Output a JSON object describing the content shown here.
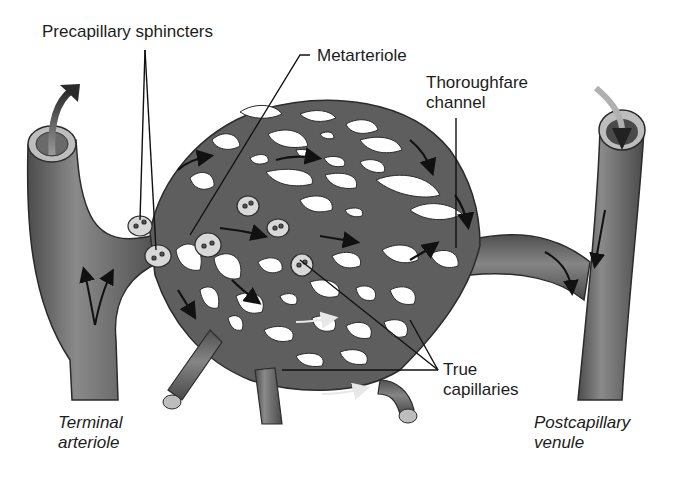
{
  "diagram": {
    "type": "anatomical-illustration",
    "colors": {
      "vessel": "#5e5e5e",
      "vessel_highlight": "#8a8a8a",
      "vessel_edge": "#2b2b2b",
      "sphincter": "#d8d8d8",
      "background": "#ffffff",
      "text": "#1c1c1c",
      "arrow": "#111111"
    },
    "labels": {
      "precapillary_sphincters": "Precapillary sphincters",
      "metarteriole": "Metarteriole",
      "thoroughfare_channel": {
        "line1": "Thoroughfare",
        "line2": "channel"
      },
      "true_capillaries": {
        "line1": "True",
        "line2": "capillaries"
      },
      "terminal_arteriole": {
        "line1": "Terminal",
        "line2": "arteriole"
      },
      "postcapillary_venule": {
        "line1": "Postcapillary",
        "line2": "venule"
      }
    },
    "icons": {
      "flow_arrow": "flow-direction-arrow-icon",
      "sphincter": "precapillary-sphincter-ring-icon"
    }
  }
}
